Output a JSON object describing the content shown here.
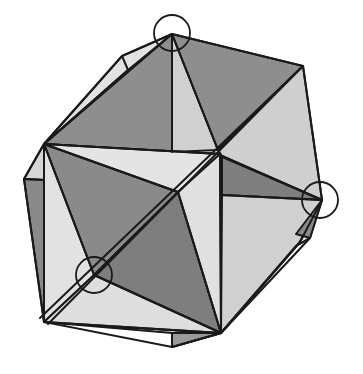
{
  "figure": {
    "title": "",
    "colors": {
      "background": "#ffffff",
      "dark_face": "#8a8a8a",
      "mid_face": "#a9a9a9",
      "light_face": "#d3d3d3",
      "lighter_face": "#e2e2e2",
      "edge": "#1a1a1a",
      "circle": "#1a1a1a"
    },
    "highlighted_vertices": [
      {
        "label": "top-vertex",
        "cx": 172,
        "cy": 33,
        "r": 18
      },
      {
        "label": "right-vertex",
        "cx": 320,
        "cy": 200,
        "r": 18
      },
      {
        "label": "lower-left-vertex",
        "cx": 94,
        "cy": 275,
        "r": 18
      }
    ]
  }
}
